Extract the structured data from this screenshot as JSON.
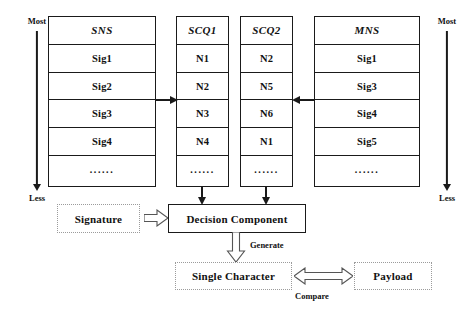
{
  "figure": {
    "axes": {
      "left": {
        "top_label": "Most",
        "bottom_label": "Less"
      },
      "right": {
        "top_label": "Most",
        "bottom_label": "Less"
      }
    },
    "tables": [
      {
        "id": "sns",
        "header": "SNS",
        "rows": [
          "Sig1",
          "Sig2",
          "Sig3",
          "Sig4",
          "......"
        ]
      },
      {
        "id": "scq1",
        "header": "SCQ1",
        "rows": [
          "N1",
          "N2",
          "N3",
          "N4",
          "......"
        ]
      },
      {
        "id": "scq2",
        "header": "SCQ2",
        "rows": [
          "N2",
          "N5",
          "N6",
          "N1",
          "......"
        ]
      },
      {
        "id": "mns",
        "header": "MNS",
        "rows": [
          "Sig1",
          "Sig3",
          "Sig4",
          "Sig5",
          "......"
        ]
      }
    ],
    "boxes": {
      "signature": "Signature",
      "decision_component": "Decision Component",
      "single_character": "Single Character",
      "payload": "Payload"
    },
    "edge_labels": {
      "generate": "Generate",
      "compare": "Compare"
    },
    "colors": {
      "stroke": "#1a1a1a",
      "dotted_stroke": "#9b9b9b",
      "background": "#ffffff"
    }
  }
}
